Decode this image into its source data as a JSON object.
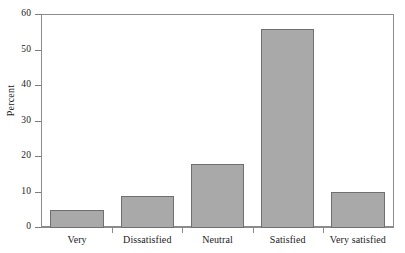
{
  "chart_data": {
    "type": "bar",
    "title": "",
    "subtitle": "",
    "xlabel": "",
    "ylabel": "Percent",
    "categories": [
      "Very",
      "Dissatisfied",
      "Neutral",
      "Satisfied",
      "Very satisfied"
    ],
    "values": [
      5.2,
      9.0,
      18.0,
      56.2,
      10.2
    ],
    "ylim": [
      0,
      60
    ],
    "ytick_labels": [
      "0",
      "10",
      "20",
      "30",
      "40",
      "50",
      "60"
    ],
    "ytick_values": [
      0,
      10,
      20,
      30,
      40,
      50,
      60
    ],
    "grid": false,
    "legend": null,
    "legend_position": "none",
    "annotations": [],
    "colors": {
      "bar_fill": "#aaa9a9",
      "bar_edge": "#6f6f6f",
      "axis": "#8b8b8b",
      "text": "#1a1a1a",
      "background": "#ffffff"
    }
  }
}
